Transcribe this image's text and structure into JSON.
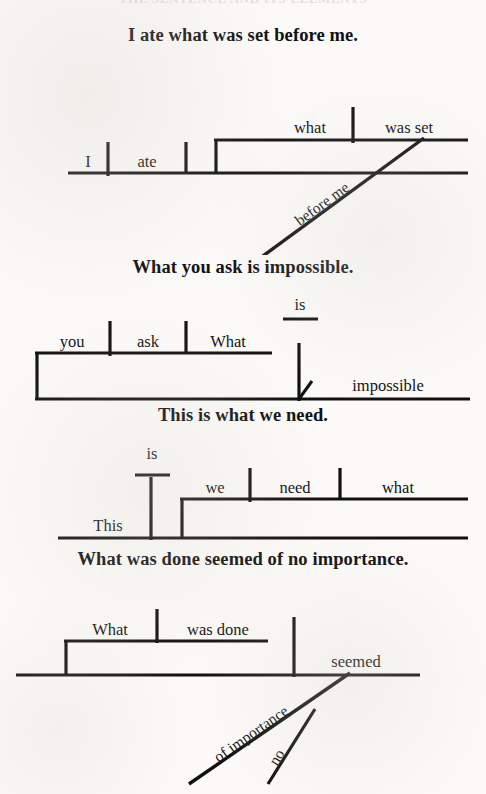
{
  "page": {
    "running_head": "THE SENTENCE AND ITS ELEMENTS",
    "background_color": "#fbfaf8",
    "ink_color": "#101010"
  },
  "diagrams": [
    {
      "id": "diagram-1",
      "sentence": "I ate what was set before me.",
      "words": {
        "subject": "I",
        "verb": "ate",
        "clause_subject": "what",
        "clause_verb": "was set",
        "modifier": "before me"
      }
    },
    {
      "id": "diagram-2",
      "sentence": "What you ask is impossible.",
      "words": {
        "clause_subject": "you",
        "clause_verb": "ask",
        "clause_object": "What",
        "verb": "is",
        "complement": "impossible"
      }
    },
    {
      "id": "diagram-3",
      "sentence": "This is what we need.",
      "words": {
        "subject": "This",
        "verb": "is",
        "clause_subject": "we",
        "clause_verb": "need",
        "clause_object": "what"
      }
    },
    {
      "id": "diagram-4",
      "sentence": "What was done seemed of no importance.",
      "words": {
        "clause_subject": "What",
        "clause_verb": "was done",
        "verb": "seemed",
        "phrase": "of importance",
        "phrase_modifier": "no"
      }
    }
  ]
}
